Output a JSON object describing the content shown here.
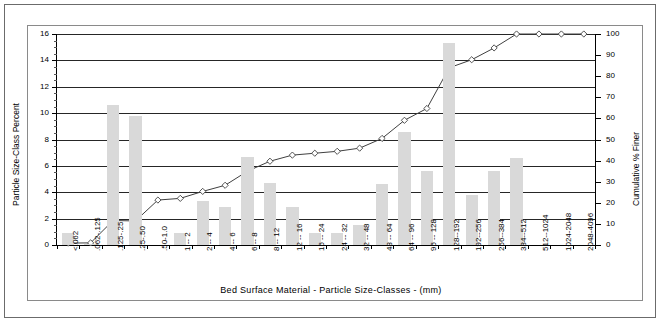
{
  "axes": {
    "y_left_title": "Particle Size-Class Percent",
    "y_right_title": "Cumulative % Finer",
    "x_title": "Bed Surface Material  -  Particle Size-Classes  - (mm)",
    "y_left_ticks": [
      "16",
      "14",
      "12",
      "10",
      "8",
      "6",
      "4",
      "2",
      "0"
    ],
    "y_right_ticks": [
      "100",
      "90",
      "80",
      "70",
      "60",
      "50",
      "40",
      "30",
      "20",
      "10",
      "0"
    ]
  },
  "chart_data": {
    "type": "bar",
    "title": "",
    "subtitle": "",
    "xlabel": "Bed Surface Material  -  Particle Size-Classes  - (mm)",
    "ylabel": "Particle Size-Class Percent",
    "y2label": "Cumulative % Finer",
    "ylim": [
      0,
      16
    ],
    "y2lim": [
      0,
      100
    ],
    "ytick_step": 2,
    "y2tick_step": 10,
    "grid": true,
    "legend": "none",
    "bar_color": "#d9d9d9",
    "line_color": "#404040",
    "marker": "diamond-open",
    "categories": [
      "<.062",
      ".062-.125",
      ".125-.25",
      ".25-.50",
      ".50-1.0",
      "1  --  2",
      "2  --  4",
      "4  --  6",
      "6  --  8",
      "8  --  12",
      "12  --  16",
      "16  --  24",
      "24  --  32",
      "32  --  48",
      "48  --  64",
      "64  --  96",
      "96  --  128",
      "128--192",
      "192--256",
      "256--384",
      "384--512",
      "512--1024",
      "1024-2048",
      "2048-4096"
    ],
    "series": [
      {
        "name": "Particle Size-Class Percent",
        "type": "bar",
        "axis": "left",
        "values": [
          0.9,
          0.1,
          10.6,
          9.8,
          0.0,
          0.9,
          3.3,
          2.9,
          6.7,
          4.7,
          2.9,
          0.9,
          0.9,
          1.5,
          4.6,
          8.6,
          5.6,
          15.3,
          3.8,
          5.6,
          6.6,
          0.0,
          0.0,
          0.0
        ]
      },
      {
        "name": "Cumulative % Finer",
        "type": "line",
        "axis": "right",
        "values": [
          0.9,
          1.0,
          11.6,
          11.4,
          21.3,
          22.1,
          25.4,
          28.3,
          35.0,
          39.7,
          42.6,
          43.5,
          44.4,
          45.9,
          50.5,
          59.1,
          64.7,
          84.0,
          87.8,
          93.4,
          100.0,
          100.0,
          100.0,
          100.0
        ]
      }
    ]
  }
}
